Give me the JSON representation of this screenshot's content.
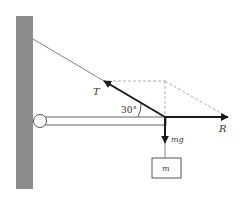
{
  "diagram": {
    "labels": {
      "tension": "T",
      "angle": "30°",
      "reaction": "R",
      "weight": "mg",
      "mass": "m"
    },
    "colors": {
      "wall": "#8c8c8c",
      "force_arrow": "#1a1a1a",
      "rope": "#555555",
      "dashed": "#999999",
      "beam_outline": "#666666"
    }
  }
}
